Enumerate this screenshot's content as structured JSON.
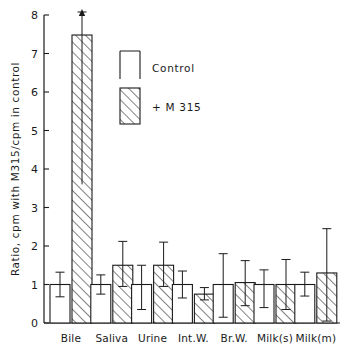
{
  "chart_data": {
    "type": "bar",
    "title": "",
    "xlabel": "",
    "ylabel": "Ratio, cpm with M315/cpm in control",
    "ylim": [
      0,
      8
    ],
    "yticks": [
      0,
      1,
      2,
      3,
      4,
      5,
      6,
      7,
      8
    ],
    "ytick_labels": [
      "0",
      "1",
      "2",
      "3",
      "4",
      "5",
      "6",
      "7",
      "8"
    ],
    "grid": false,
    "legend_position": "upper-center",
    "categories": [
      "Bile",
      "Saliva",
      "Urine",
      "Int.W.",
      "Br.W.",
      "Milk(s)",
      "Milk(m)"
    ],
    "series": [
      {
        "name": "Control",
        "style": "open",
        "values": [
          1.0,
          1.0,
          1.0,
          1.0,
          1.0,
          1.0,
          1.0
        ],
        "err_low": [
          0.68,
          0.75,
          0.35,
          0.65,
          0.15,
          0.4,
          0.7
        ],
        "err_high": [
          1.32,
          1.25,
          1.5,
          1.35,
          1.8,
          1.38,
          1.32
        ]
      },
      {
        "name": "+ M 315",
        "style": "hatched",
        "values": [
          7.48,
          1.5,
          1.5,
          0.75,
          1.05,
          1.0,
          1.3
        ],
        "err_low": [
          3.6,
          0.95,
          0.95,
          0.6,
          0.45,
          0.35,
          0.05
        ],
        "err_high": [
          8.3,
          2.12,
          2.1,
          0.92,
          1.62,
          1.65,
          2.45
        ],
        "err_high_clipped": [
          true,
          false,
          false,
          false,
          false,
          false,
          false
        ]
      }
    ],
    "annotations": [
      {
        "text": "arrow-up",
        "category": "Bile",
        "series": "+ M 315",
        "note": "error bar extends above axis maximum"
      }
    ]
  },
  "legend": {
    "items": [
      {
        "label": "Control",
        "swatch": "open-bar-swatch"
      },
      {
        "label": "+ M 315",
        "swatch": "hatched-bar-swatch"
      }
    ]
  },
  "axes": {
    "y_title": "Ratio, cpm with M315/cpm in control",
    "y_tick_labels": [
      "8",
      "7",
      "6",
      "5",
      "4",
      "3",
      "2",
      "1",
      "0"
    ],
    "x_tick_labels": [
      "Bile",
      "Saliva",
      "Urine",
      "Int.W.",
      "Br.W.",
      "Milk(s)",
      "Milk(m)"
    ]
  },
  "colors": {
    "ink": "#1a1a1a",
    "background": "#ffffff"
  }
}
